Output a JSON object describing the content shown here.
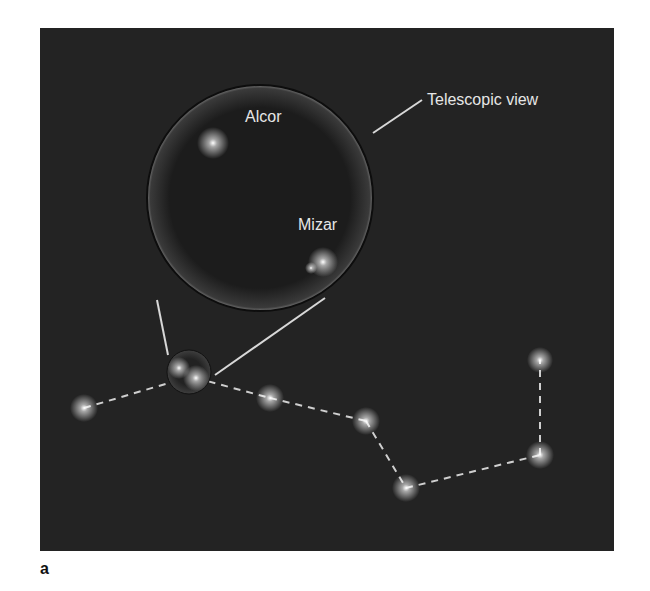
{
  "figure": {
    "panel_label": "a",
    "background_color": "#232323",
    "labels": {
      "telescopic_view": "Telescopic view",
      "alcor": "Alcor",
      "mizar": "Mizar"
    },
    "constellation": {
      "name_hint": "Big Dipper",
      "stars": [
        {
          "id": "star-1",
          "x": 84,
          "y": 408
        },
        {
          "id": "alcor-small",
          "x": 179,
          "y": 368
        },
        {
          "id": "mizar-small",
          "x": 196,
          "y": 378
        },
        {
          "id": "star-4",
          "x": 270,
          "y": 398
        },
        {
          "id": "star-5",
          "x": 366,
          "y": 421
        },
        {
          "id": "star-6",
          "x": 406,
          "y": 488
        },
        {
          "id": "star-7",
          "x": 540,
          "y": 455
        },
        {
          "id": "star-8",
          "x": 540,
          "y": 360
        }
      ]
    },
    "telescope_circle": {
      "cx": 260,
      "cy": 198,
      "r": 113
    },
    "inset_stars": [
      {
        "id": "alcor-large",
        "x": 213,
        "y": 143
      },
      {
        "id": "mizar-large-a",
        "x": 323,
        "y": 262
      },
      {
        "id": "mizar-large-b",
        "x": 311,
        "y": 268
      }
    ]
  }
}
